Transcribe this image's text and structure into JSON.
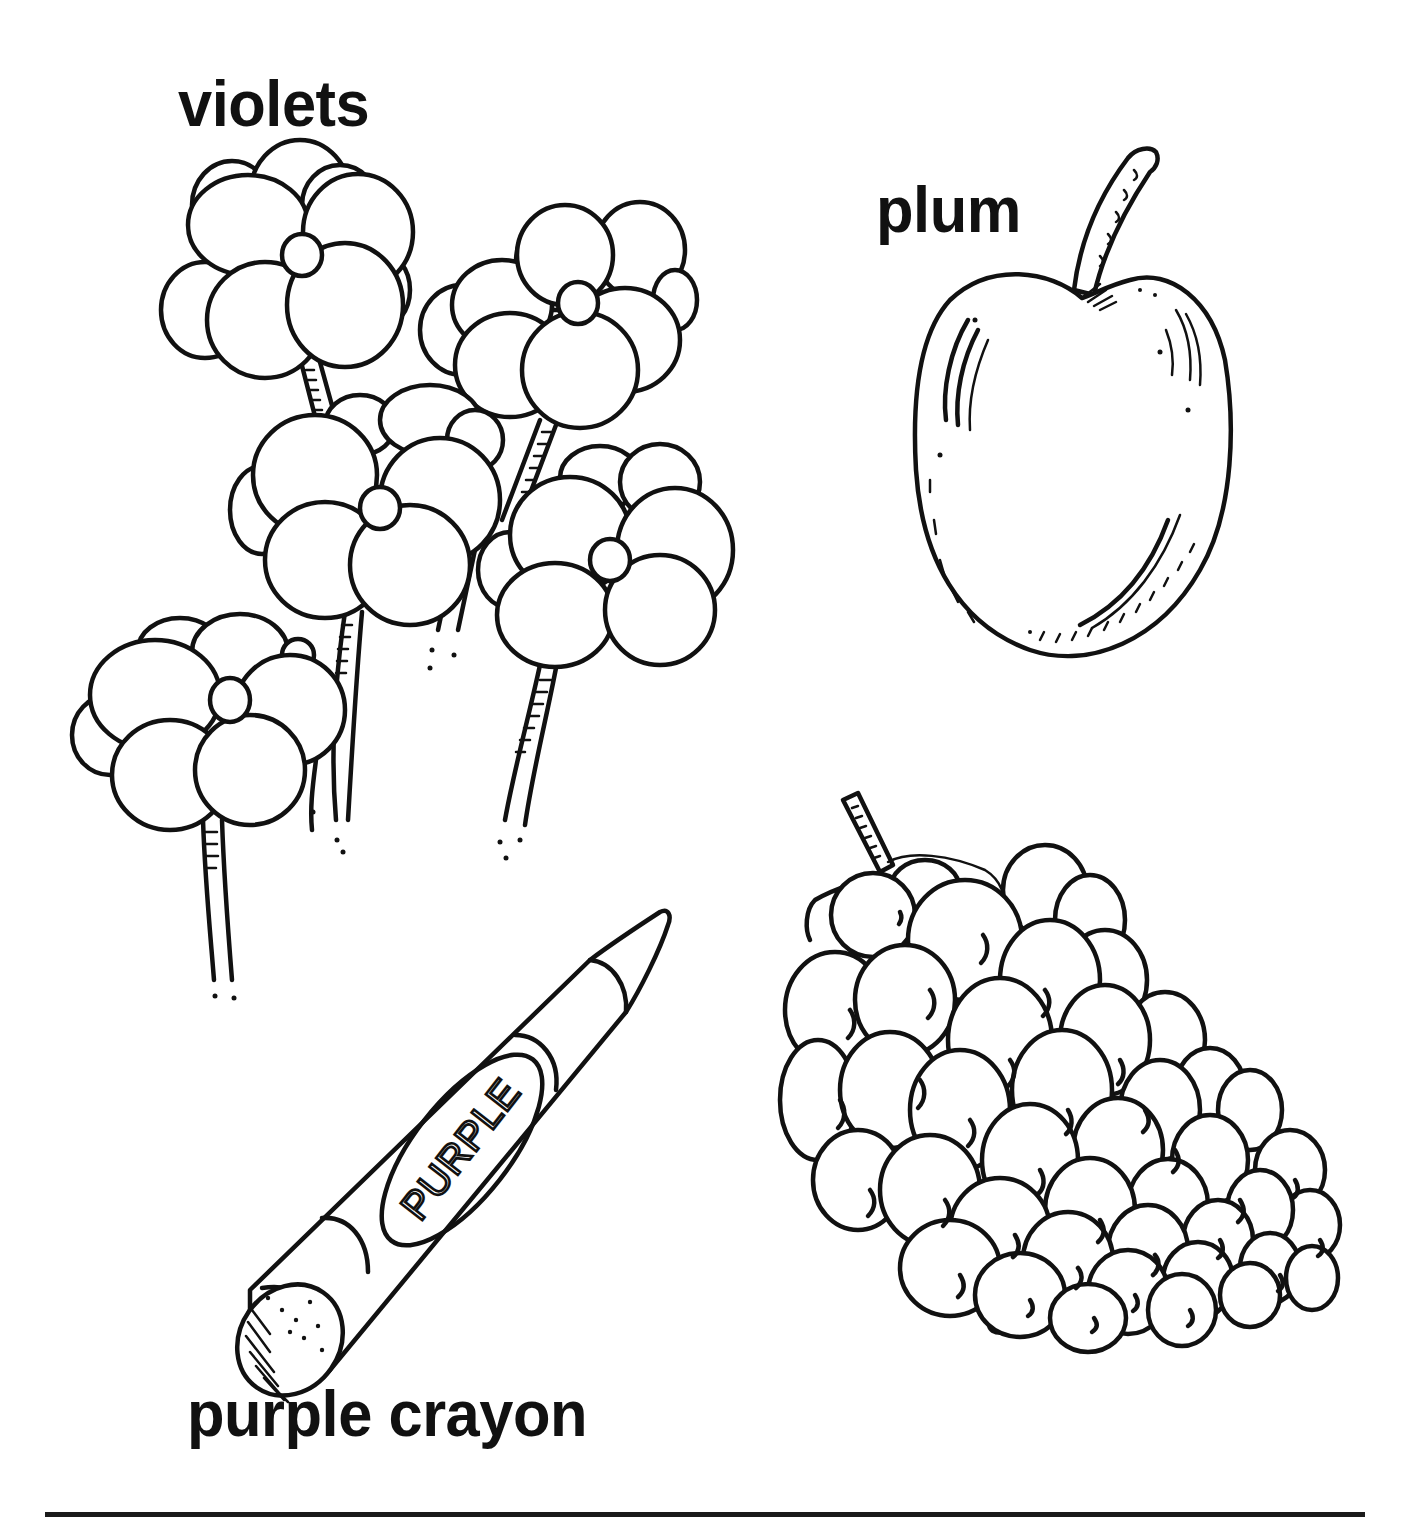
{
  "worksheet": {
    "theme_color": "purple",
    "ink_color": "#111111",
    "paper_color": "#ffffff",
    "items": [
      {
        "id": "violets",
        "label": "violets"
      },
      {
        "id": "plum",
        "label": "plum"
      },
      {
        "id": "grapes",
        "label": "grapes"
      },
      {
        "id": "purple_crayon",
        "label": "purple crayon",
        "wrapper_text": "PURPLE"
      }
    ]
  },
  "icons": {
    "violets": "violets-flowers-drawing",
    "plum": "plum-fruit-drawing",
    "grapes": "grape-bunch-drawing",
    "crayon": "crayon-drawing"
  }
}
